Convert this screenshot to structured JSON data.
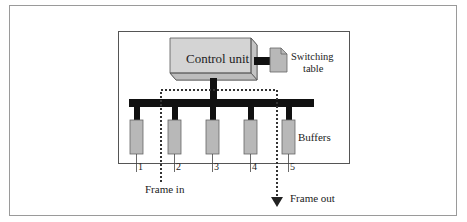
{
  "diagram": {
    "control_unit_label": "Control unit",
    "switching_table_label_line1": "Switching",
    "switching_table_label_line2": "table",
    "buffers_label": "Buffers",
    "ports": [
      "1",
      "2",
      "3",
      "4",
      "5"
    ],
    "frame_in_label": "Frame in",
    "frame_out_label": "Frame out",
    "colors": {
      "box_fill": "#d4d4d4",
      "box_side": "#bdbdbd",
      "buffer_fill": "#b8b8b8",
      "bus": "#111111",
      "border": "#555555"
    }
  }
}
